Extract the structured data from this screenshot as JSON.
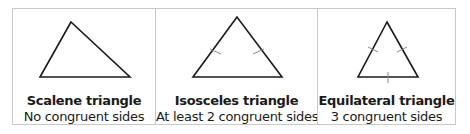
{
  "panels": [
    {
      "title": "Scalene triangle",
      "subtitle": "No congruent sides",
      "shape": "scalene-triangle",
      "tick_marks": 0
    },
    {
      "title": "Isosceles triangle",
      "subtitle": "At least 2 congruent sides",
      "shape": "isosceles-triangle",
      "tick_marks": 2
    },
    {
      "title": "Equilateral triangle",
      "subtitle": "3 congruent sides",
      "shape": "equilateral-triangle",
      "tick_marks": 3
    }
  ],
  "colors": {
    "border": "#c8c8c8",
    "stroke": "#1a1a1a",
    "tick": "#888888",
    "text": "#1a1a1a"
  }
}
